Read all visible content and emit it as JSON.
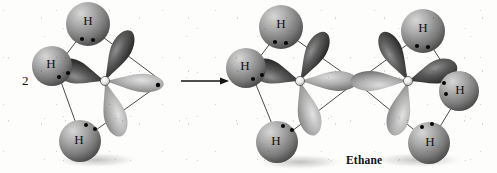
{
  "figure": {
    "background_color": "#fdfdfc",
    "style": "grayscale textbook orbital illustration",
    "coefficient_label": "2",
    "caption": "Ethane",
    "arrow": {
      "name": "reaction-arrow",
      "direction": "right",
      "x1": 181,
      "x2": 229,
      "y": 81
    },
    "colors": {
      "sphere_light": "#b9b9b9",
      "sphere_mid": "#8d8d8d",
      "sphere_dark": "#3a3a3a",
      "lobe_light": "#d5d5d5",
      "lobe_mid": "#8a8a8a",
      "lobe_dark": "#2b2b2b",
      "bond_line": "#1a1a1a",
      "electron_dot": "#050505",
      "label_text": "#111111",
      "shadow": "#9a9a9a"
    },
    "molecules": [
      {
        "name": "methyl-radical",
        "side": "left",
        "carbon": {
          "label": "C",
          "x": 105,
          "y": 81
        },
        "hydrogens": [
          {
            "label": "H",
            "x": 88,
            "y": 22,
            "position": "top"
          },
          {
            "label": "H",
            "x": 52,
            "y": 65,
            "position": "left"
          },
          {
            "label": "H",
            "x": 80,
            "y": 141,
            "position": "bottom"
          }
        ],
        "orbitals": [
          {
            "name": "sp3-orbital-top",
            "angle": -68
          },
          {
            "name": "sp3-orbital-left",
            "angle": 200
          },
          {
            "name": "sp3-orbital-bottom",
            "angle": 72
          },
          {
            "name": "sp3-orbital-right-unpaired",
            "angle": 4
          }
        ],
        "electron_pairs": 3,
        "unpaired_electron": true
      },
      {
        "name": "ethane-carbon-left",
        "side": "right-product-left",
        "carbon": {
          "label": "C",
          "x": 300,
          "y": 81
        },
        "hydrogens": [
          {
            "label": "H",
            "x": 281,
            "y": 25,
            "position": "top"
          },
          {
            "label": "H",
            "x": 246,
            "y": 67,
            "position": "left"
          },
          {
            "label": "H",
            "x": 277,
            "y": 142,
            "position": "bottom"
          }
        ],
        "orbitals": [
          {
            "name": "sp3-orbital-top",
            "angle": -68
          },
          {
            "name": "sp3-orbital-left",
            "angle": 200
          },
          {
            "name": "sp3-orbital-bottom",
            "angle": 72
          },
          {
            "name": "sp3-sigma-bond-right",
            "angle": 0
          }
        ]
      },
      {
        "name": "ethane-carbon-right",
        "side": "right-product-right",
        "carbon": {
          "label": "C",
          "x": 408,
          "y": 81
        },
        "hydrogens": [
          {
            "label": "H",
            "x": 423,
            "y": 30,
            "position": "top"
          },
          {
            "label": "H",
            "x": 458,
            "y": 90,
            "position": "right"
          },
          {
            "label": "H",
            "x": 428,
            "y": 142,
            "position": "bottom"
          }
        ],
        "orbitals": [
          {
            "name": "sp3-orbital-top",
            "angle": -112
          },
          {
            "name": "sp3-orbital-right",
            "angle": -20
          },
          {
            "name": "sp3-orbital-bottom",
            "angle": 108
          },
          {
            "name": "sp3-sigma-bond-left",
            "angle": 180
          }
        ]
      }
    ],
    "sigma_bond": {
      "name": "carbon-carbon-sigma-bond",
      "from_x": 300,
      "to_x": 408,
      "y": 81
    }
  }
}
